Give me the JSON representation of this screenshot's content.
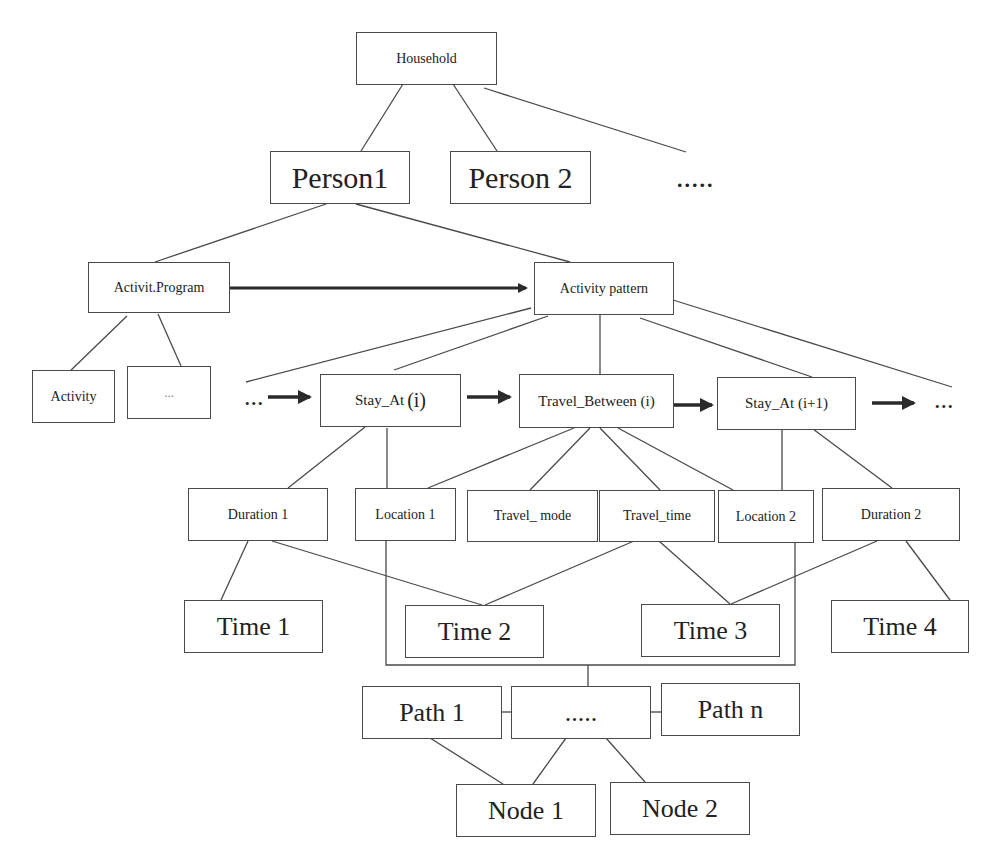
{
  "diagram": {
    "type": "hierarchy",
    "colors": {
      "line": "#4a4a4a",
      "arrow": "#2a2a2a",
      "box_border": "#4a4a4a",
      "background": "#ffffff"
    },
    "nodes": {
      "household": "Household",
      "person1": "Person1",
      "person2": "Person 2",
      "more_persons": ".....",
      "activity_program": "Activit.Program",
      "activity_pattern": "Activity pattern",
      "activity": "Activity",
      "activity_more": "...",
      "seq_start": "...",
      "stay_at_i": "Stay_At",
      "stay_at_i_idx": "(i)",
      "travel_between_i": "Travel_Between (i)",
      "stay_at_i1": "Stay_At (i+1)",
      "seq_end": "...",
      "duration1": "Duration 1",
      "location1": "Location 1",
      "travel_mode": "Travel_ mode",
      "travel_time": "Travel_time",
      "location2": "Location 2",
      "duration2": "Duration 2",
      "time1": "Time 1",
      "time2": "Time 2",
      "time3": "Time 3",
      "time4": "Time 4",
      "path1": "Path 1",
      "path_more": ".....",
      "path_n": "Path n",
      "node1": "Node 1",
      "node2": "Node 2"
    }
  }
}
